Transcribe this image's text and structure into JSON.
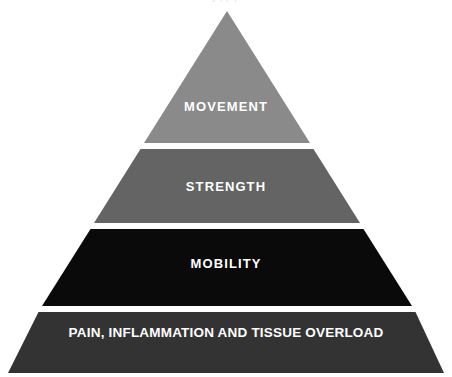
{
  "diagram": {
    "type": "pyramid",
    "title_remnant": "y  pp           p",
    "background_color": "#ffffff",
    "divider_color": "#ffffff",
    "apex": {
      "x": 227,
      "y": 11
    },
    "base": {
      "left_x": 8,
      "right_x": 444,
      "y": 373
    },
    "levels": [
      {
        "id": "movement",
        "rank": 1,
        "position": "top",
        "label": "MOVEMENT",
        "fill_color": "#8a8a8a",
        "text_color": "#ffffff",
        "top_y": 11,
        "bottom_y": 143
      },
      {
        "id": "strength",
        "rank": 2,
        "position": "upper-middle",
        "label": "STRENGTH",
        "fill_color": "#646464",
        "text_color": "#ffffff",
        "top_y": 149,
        "bottom_y": 223
      },
      {
        "id": "mobility",
        "rank": 3,
        "position": "lower-middle",
        "label": "MOBILITY",
        "fill_color": "#0a0a0a",
        "text_color": "#ffffff",
        "top_y": 229,
        "bottom_y": 306
      },
      {
        "id": "pain-inflammation",
        "rank": 4,
        "position": "base",
        "label": "PAIN, INFLAMMATION AND TISSUE OVERLOAD",
        "fill_color": "#333333",
        "text_color": "#ffffff",
        "top_y": 312,
        "bottom_y": 373
      }
    ]
  }
}
